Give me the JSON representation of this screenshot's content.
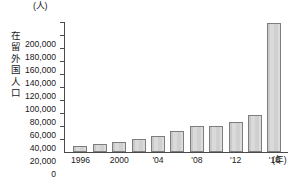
{
  "chart_data": {
    "type": "bar",
    "title": "",
    "xlabel": "(年)",
    "ylabel": "在留外国人口",
    "yunit": "(人)",
    "ylim": [
      0,
      200000
    ],
    "ytick_step": 20000,
    "grid": false,
    "legend": null,
    "categories": [
      "1996",
      "1998",
      "2000",
      "2002",
      "2004",
      "2006",
      "2008",
      "2010",
      "2012",
      "2014",
      "2016"
    ],
    "xtick_labels": [
      {
        "category": "1996",
        "text": "1996"
      },
      {
        "category": "2000",
        "text": "2000"
      },
      {
        "category": "2004",
        "text": "'04"
      },
      {
        "category": "2008",
        "text": "'08"
      },
      {
        "category": "2012",
        "text": "'12"
      },
      {
        "category": "2016",
        "text": "'16"
      }
    ],
    "ytick_labels": [
      "0",
      "20,000",
      "40,000",
      "60,000",
      "80,000",
      "100,000",
      "120,000",
      "140,000",
      "160,000",
      "180,000",
      "200,000"
    ],
    "values": [
      9000,
      13000,
      16000,
      20000,
      25000,
      32000,
      40000,
      40000,
      46000,
      57000,
      98000
    ],
    "values_last": 199000,
    "bar_color": "#d2d2d2",
    "bar_border_color": "#7d7d7d",
    "axis_color": "#4a4a4a"
  }
}
